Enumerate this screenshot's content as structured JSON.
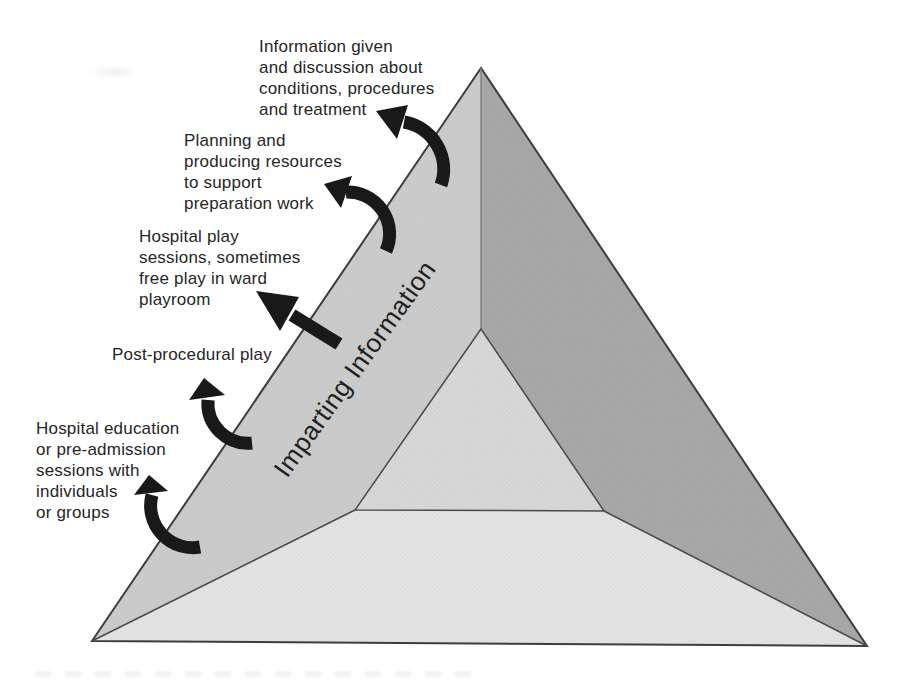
{
  "diagram": {
    "face_label": "Imparting Information",
    "callouts": [
      {
        "text": "Information given\nand discussion about\nconditions, procedures\nand treatment"
      },
      {
        "text": "Planning and\nproducing resources\nto support\npreparation work"
      },
      {
        "text": "Hospital play\nsessions, sometimes\nfree play in ward\nplayroom"
      },
      {
        "text": "Post-procedural play"
      },
      {
        "text": "Hospital education\nor pre-admission\nsessions with\nindividuals\nor groups"
      }
    ],
    "colors": {
      "left_face": "#cccccc",
      "right_face": "#a8a8a8",
      "bottom_face": "#e4e4e4",
      "inner_triangle": "#d8d8d8",
      "arrow": "#191919"
    }
  }
}
